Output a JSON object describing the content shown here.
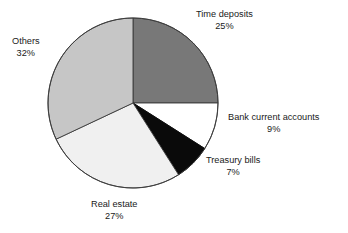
{
  "chart_data": {
    "type": "pie",
    "title": "",
    "subtitle": "",
    "xlabel": "",
    "ylabel": "",
    "legend_position": "none",
    "grid": false,
    "total": 100,
    "units": "%",
    "start_angle_deg": 0,
    "direction": "clockwise",
    "center": {
      "x": 133,
      "y": 103
    },
    "radius": 85,
    "categories": [
      "Time deposits",
      "Bank current accounts",
      "Treasury bills",
      "Real estate",
      "Others"
    ],
    "values": [
      25,
      9,
      7,
      27,
      32
    ],
    "slices": [
      {
        "name": "time-deposits",
        "label": "Time deposits",
        "value": 25,
        "value_text": "25%",
        "color": "#787878",
        "stroke": "#3a3a3a",
        "start_deg": 0,
        "end_deg": 90
      },
      {
        "name": "bank-current-accounts",
        "label": "Bank current accounts",
        "value": 9,
        "value_text": "9%",
        "color": "#ffffff",
        "stroke": "#3a3a3a",
        "start_deg": 90,
        "end_deg": 122.4
      },
      {
        "name": "treasury-bills",
        "label": "Treasury bills",
        "value": 7,
        "value_text": "7%",
        "color": "#0a0a0a",
        "stroke": "#0a0a0a",
        "start_deg": 122.4,
        "end_deg": 147.6
      },
      {
        "name": "real-estate",
        "label": "Real estate",
        "value": 27,
        "value_text": "27%",
        "color": "#f0f0f0",
        "stroke": "#3a3a3a",
        "start_deg": 147.6,
        "end_deg": 244.8
      },
      {
        "name": "others",
        "label": "Others",
        "value": 32,
        "value_text": "32%",
        "color": "#c6c6c6",
        "stroke": "#3a3a3a",
        "start_deg": 244.8,
        "end_deg": 360
      }
    ],
    "colors": {
      "time_deposits": "#787878",
      "bank_current_accounts": "#ffffff",
      "treasury_bills": "#0a0a0a",
      "real_estate": "#f0f0f0",
      "others": "#c6c6c6",
      "outline": "#3a3a3a",
      "text": "#1a1a1a",
      "background": "#ffffff"
    }
  }
}
